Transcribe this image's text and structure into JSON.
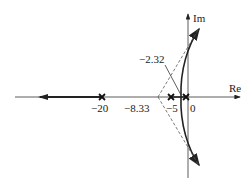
{
  "diagram": {
    "type": "root-locus",
    "axes": {
      "x_label": "Re",
      "y_label": "Im"
    },
    "poles": [
      {
        "label": "0",
        "value": 0
      },
      {
        "label": "−5",
        "value": -5
      },
      {
        "label": "−20",
        "value": -20
      }
    ],
    "annotations": {
      "asymptote_centroid": "−8.33",
      "breakaway_point": "−2.32"
    },
    "colors": {
      "line": "#222222",
      "dashed": "#555555"
    }
  }
}
